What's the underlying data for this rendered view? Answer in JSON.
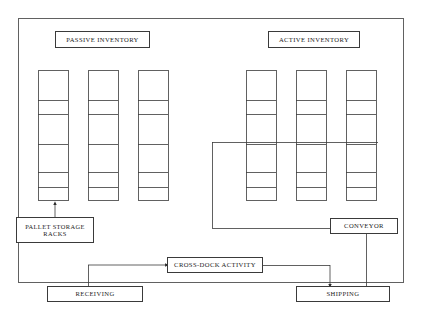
{
  "diagram": {
    "type": "warehouse-facility-flow",
    "line_color": "#3a3a3a",
    "text_color": "#1b1b1b",
    "background": "#ffffff"
  },
  "zones": {
    "passive": {
      "label": "PASSIVE INVENTORY",
      "box": {
        "x": 55,
        "y": 31,
        "w": 95,
        "h": 17
      },
      "font_size": 6.6
    },
    "active": {
      "label": "ACTIVE INVENTORY",
      "box": {
        "x": 268,
        "y": 31,
        "w": 92,
        "h": 17
      },
      "font_size": 6.6
    }
  },
  "racks": {
    "count": 6,
    "shelf_divider_offsets": [
      30,
      44,
      74,
      102,
      117
    ],
    "height": 130,
    "width": 30,
    "top": 70,
    "columns": [
      {
        "name": "passive-rack-1",
        "x": 38
      },
      {
        "name": "passive-rack-2",
        "x": 88
      },
      {
        "name": "passive-rack-3",
        "x": 138
      },
      {
        "name": "active-rack-1",
        "x": 246
      },
      {
        "name": "active-rack-2",
        "x": 296
      },
      {
        "name": "active-rack-3",
        "x": 346
      }
    ]
  },
  "nodes": {
    "pallet_storage": {
      "label": "PALLET STORAGE\nRACKS",
      "box": {
        "x": 16,
        "y": 217,
        "w": 78,
        "h": 26
      },
      "font_size": 6.4
    },
    "conveyor": {
      "label": "CONVEYOR",
      "box": {
        "x": 330,
        "y": 218,
        "w": 68,
        "h": 16
      },
      "font_size": 6.6
    },
    "cross_dock": {
      "label": "CROSS-DOCK ACTIVITY",
      "box": {
        "x": 167,
        "y": 257,
        "w": 96,
        "h": 16
      },
      "font_size": 6.6
    },
    "receiving": {
      "label": "RECEIVING",
      "box": {
        "x": 47,
        "y": 286,
        "w": 96,
        "h": 16
      },
      "font_size": 6.6
    },
    "shipping": {
      "label": "SHIPPING",
      "box": {
        "x": 296,
        "y": 286,
        "w": 94,
        "h": 16
      },
      "font_size": 6.6
    }
  },
  "boundary": {
    "name": "warehouse-outline",
    "x": 18,
    "y": 18,
    "w": 385,
    "h": 264
  },
  "connectors": [
    {
      "name": "pallet-to-rack",
      "from": "pallet_storage",
      "to": "passive-rack-1",
      "arrow": "up"
    },
    {
      "name": "conveyor-loop",
      "from": "conveyor",
      "to": "active-racks",
      "arrow": "none"
    },
    {
      "name": "conveyor-to-shipping",
      "from": "conveyor",
      "to": "shipping",
      "arrow": "none"
    },
    {
      "name": "receiving-to-crossdock",
      "from": "receiving",
      "to": "cross_dock",
      "arrow": "right"
    },
    {
      "name": "crossdock-to-shipping",
      "from": "cross_dock",
      "to": "shipping",
      "arrow": "down"
    }
  ]
}
